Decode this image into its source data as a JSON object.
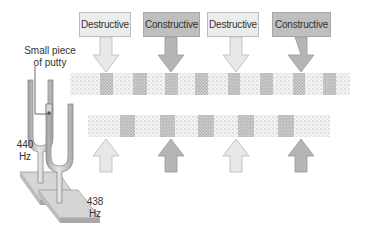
{
  "figure": {
    "labels": [
      {
        "text": "Destructive",
        "type": "destructive"
      },
      {
        "text": "Constructive",
        "type": "constructive"
      },
      {
        "text": "Destructive",
        "type": "destructive"
      },
      {
        "text": "Constructive",
        "type": "constructive"
      }
    ],
    "annotations": {
      "putty_line1": "Small piece",
      "putty_line2": "of putty",
      "fork1_freq": "440",
      "fork1_unit": "Hz",
      "fork2_freq": "438",
      "fork2_unit": "Hz"
    },
    "colors": {
      "destructive_fill": "#ececec",
      "constructive_fill": "#bfbfbf",
      "arrow_light": "#e8e8e8",
      "arrow_dark": "#b5b5b5",
      "fork_metal": "#c8c8c8",
      "base_top": "#d6d6d6",
      "base_side": "#a9a9a9"
    }
  }
}
